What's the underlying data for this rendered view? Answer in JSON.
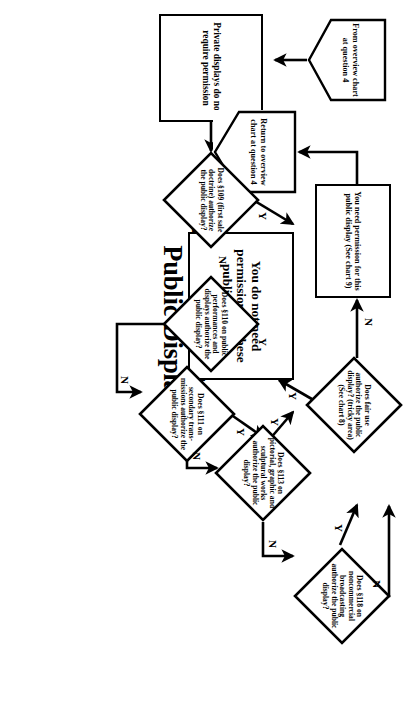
{
  "chart": {
    "title_line1": "Decision Chart 4:",
    "title_line2": "Public Display",
    "type": "decision-flowchart",
    "orientation": "page rotated 90 degrees clockwise"
  },
  "nodes": {
    "entry": {
      "shape": "pentagon-connector",
      "text": "From overview chart at question 4"
    },
    "private": {
      "shape": "process-box",
      "text": "Private displays do not require permission"
    },
    "q41": {
      "shape": "decision-diamond",
      "number": "4.1",
      "text": "Does §109 (first sale doctrine) authorize the public display?"
    },
    "q42": {
      "shape": "decision-diamond",
      "number": "4.2",
      "text": "Does §110 on public performances and displays authorize the public display?"
    },
    "q43": {
      "shape": "decision-diamond",
      "number": "4.3",
      "text": "Does §111 on secondary trans- missions authorize the public display?"
    },
    "q44": {
      "shape": "decision-diamond",
      "number": "4.4",
      "text": "Does §113 on pictorial, graphic and sculptural works authorize the public display?"
    },
    "q45": {
      "shape": "decision-diamond",
      "number": "4.5",
      "text": "Does §118 on noncommercial broadcasting authorize the public display?"
    },
    "fairuse": {
      "shape": "decision-diamond",
      "text": "Does fair use authorize the public display? (tricky area) (See chart 8)"
    },
    "no_permission": {
      "shape": "process-box",
      "text": "You do not need permission for these public displays"
    },
    "need_permission": {
      "shape": "process-box",
      "text": "You need permission for this public display (See chart 9)"
    },
    "return": {
      "shape": "pentagon-connector",
      "text": "Return to overview chart at question 4"
    }
  },
  "branch_labels": {
    "q41_yes": "Y",
    "q41_no": "N",
    "q42_yes": "Y",
    "q42_no": "N",
    "q43_yes": "Y",
    "q43_no": "N",
    "q44_yes": "Y",
    "q44_no": "N",
    "q45_yes": "Y",
    "q45_no": "N",
    "fairuse_yes": "Y",
    "fairuse_no": "N"
  },
  "edges": [
    {
      "from": "entry",
      "to": "private",
      "label": ""
    },
    {
      "from": "private",
      "to": "q41",
      "label": ""
    },
    {
      "from": "q41",
      "to": "no_permission",
      "label": "Y"
    },
    {
      "from": "q41",
      "to": "q42",
      "label": "N"
    },
    {
      "from": "q42",
      "to": "no_permission",
      "label": "Y"
    },
    {
      "from": "q42",
      "to": "q43",
      "label": "N"
    },
    {
      "from": "q43",
      "to": "no_permission",
      "label": "Y"
    },
    {
      "from": "q43",
      "to": "q44",
      "label": "N"
    },
    {
      "from": "q44",
      "to": "no_permission",
      "label": "Y"
    },
    {
      "from": "q44",
      "to": "q45",
      "label": "N"
    },
    {
      "from": "q45",
      "to": "fairuse",
      "label": "Y"
    },
    {
      "from": "q45",
      "to": "need_permission",
      "label": "N"
    },
    {
      "from": "fairuse",
      "to": "no_permission",
      "label": "Y"
    },
    {
      "from": "fairuse",
      "to": "need_permission",
      "label": "N"
    },
    {
      "from": "no_permission",
      "to": "return",
      "label": ""
    }
  ],
  "scan_footer": "",
  "colors": {
    "ink": "#000000",
    "paper": "#ffffff"
  }
}
